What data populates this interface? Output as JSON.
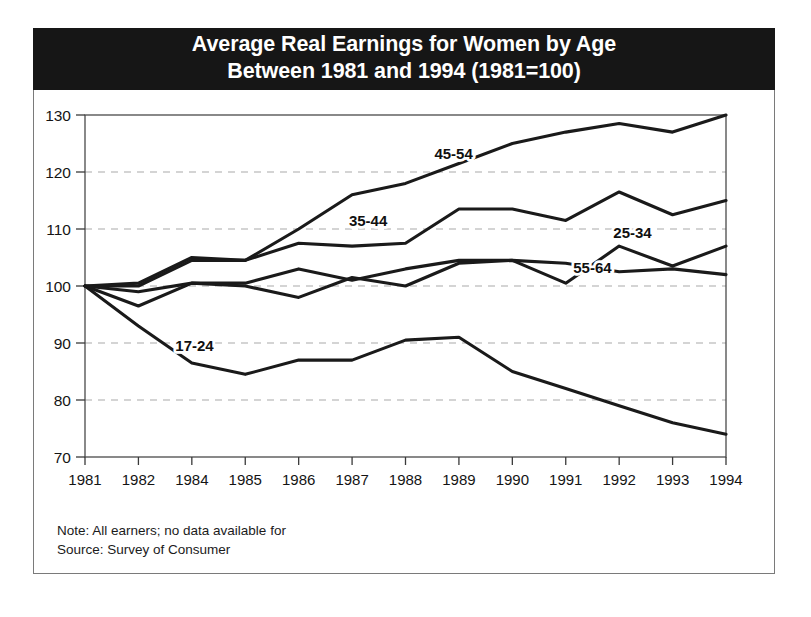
{
  "figure": {
    "title_line1": "Average Real Earnings for Women by Age",
    "title_line2": "Between 1981 and 1994 (1981=100)",
    "note": "Note: All earners; no data available for",
    "source": "Source: Survey of Consumer",
    "banner_color": "#161616",
    "line_color": "#1a1a1a",
    "grid_color": "#a9a9a9",
    "axis_color": "#4a4a4a"
  },
  "chart_data": {
    "type": "line",
    "title": "Average Real Earnings for Women by Age Between 1981 and 1994 (1981=100)",
    "xlabel": "",
    "ylabel": "",
    "x": [
      "1981",
      "1982",
      "1984",
      "1985",
      "1986",
      "1987",
      "1988",
      "1989",
      "1990",
      "1991",
      "1992",
      "1993",
      "1994"
    ],
    "xlim": [
      0,
      12
    ],
    "ylim": [
      70,
      130
    ],
    "yticks": [
      70,
      80,
      90,
      100,
      110,
      120,
      130
    ],
    "grid": "horizontal-dashed",
    "legend": "inline-labels",
    "series": [
      {
        "name": "17-24",
        "values": [
          100,
          93,
          86.5,
          84.5,
          87,
          87,
          90.5,
          91,
          85,
          82,
          79,
          76,
          74
        ],
        "label_x": 2.05,
        "label_y": 88.6
      },
      {
        "name": "25-34",
        "values": [
          100,
          96.5,
          100.5,
          100.5,
          103,
          101,
          103,
          104.5,
          104.5,
          100.5,
          107,
          103.5,
          107
        ],
        "label_x": 10.25,
        "label_y": 108.5
      },
      {
        "name": "35-44",
        "values": [
          100,
          100.5,
          105,
          104.5,
          107.5,
          107,
          107.5,
          113.5,
          113.5,
          111.5,
          116.5,
          112.5,
          115
        ],
        "label_x": 5.3,
        "label_y": 110.6
      },
      {
        "name": "45-54",
        "values": [
          100,
          100,
          104.5,
          104.5,
          110,
          116,
          118,
          121.5,
          125,
          127,
          128.5,
          127,
          130
        ],
        "label_x": 6.9,
        "label_y": 122.2
      },
      {
        "name": "55-64",
        "values": [
          100,
          99,
          100.5,
          100,
          98,
          101.5,
          100,
          104,
          104.5,
          104,
          102.5,
          103,
          102
        ],
        "label_x": 9.5,
        "label_y": 102.3
      }
    ]
  }
}
